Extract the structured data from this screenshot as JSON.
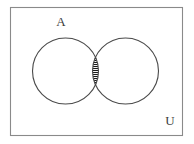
{
  "diagram": {
    "type": "venn-two-set",
    "universe": {
      "label": "U",
      "label_name": "universal-set-label",
      "x": 10,
      "y": 7,
      "width": 173,
      "height": 129,
      "stroke": "#8a8a8a",
      "fill": "#ffffff",
      "label_x": 170,
      "label_y": 125
    },
    "sets": [
      {
        "id": "A",
        "label": "A",
        "cx": 65.5,
        "cy": 71,
        "r": 33,
        "stroke": "#4a4a4a",
        "fill": "none",
        "label_x": 61,
        "label_y": 26
      },
      {
        "id": "B",
        "label": "",
        "cx": 125.5,
        "cy": 71,
        "r": 33,
        "stroke": "#4a4a4a",
        "fill": "none",
        "label_x": 0,
        "label_y": 0
      }
    ],
    "intersection": {
      "name": "intersection-region",
      "shaded": true,
      "hatch_style": "horizontal-lines",
      "hatch_spacing": 2,
      "hatch_color": "#1a1a1a",
      "hatch_width": 1,
      "top_y": 47.4,
      "bottom_y": 94.6,
      "left_x": 92.5,
      "right_x": 98.5
    },
    "colors": {
      "background": "#ffffff",
      "outline": "#4a4a4a",
      "rectangle": "#8a8a8a",
      "hatch": "#1a1a1a",
      "text": "#3b3b3b"
    }
  }
}
